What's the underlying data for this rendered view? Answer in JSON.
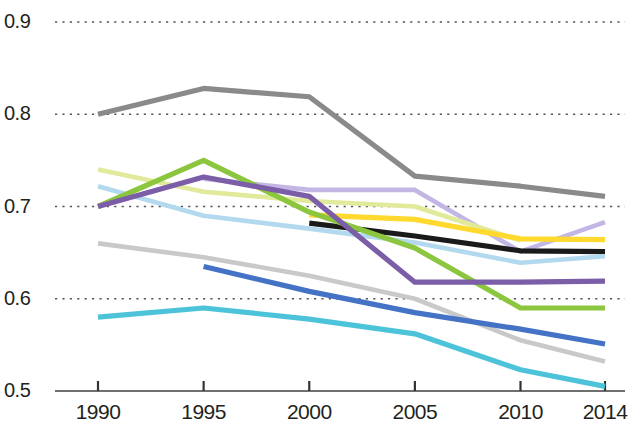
{
  "chart_data": {
    "type": "line",
    "title": "",
    "subtitle": "",
    "xlabel": "",
    "ylabel": "",
    "x": [
      1990,
      1995,
      2000,
      2005,
      2010,
      2014
    ],
    "xlim": [
      1988.2,
      2015.3
    ],
    "ylim": [
      0.5,
      0.92
    ],
    "grid": true,
    "grid_axis": "y",
    "grid_style": "dotted",
    "legend": "none",
    "xtick_labels": [
      "1990",
      "1995",
      "2000",
      "2005",
      "2010",
      "2014"
    ],
    "ytick_labels": [
      "0.9",
      "0.8",
      "0.7",
      "0.6",
      "0.5"
    ],
    "ytick_values": [
      0.9,
      0.8,
      0.7,
      0.6,
      0.5
    ],
    "series": [
      {
        "name": "dark-gray",
        "color": "#8a8a8a",
        "x": [
          1990,
          1995,
          2000,
          2005,
          2010,
          2014
        ],
        "values": [
          0.8,
          0.828,
          0.819,
          0.733,
          0.722,
          0.711
        ]
      },
      {
        "name": "lavender",
        "color": "#c3b6e4",
        "x": [
          1995,
          2000,
          2005,
          2010,
          2014
        ],
        "values": [
          0.73,
          0.718,
          0.718,
          0.651,
          0.683
        ]
      },
      {
        "name": "pale-yellow-green",
        "color": "#e1ea9b",
        "x": [
          1990,
          1995,
          2000,
          2005,
          2010
        ],
        "values": [
          0.74,
          0.716,
          0.706,
          0.7,
          0.663
        ]
      },
      {
        "name": "yellow",
        "color": "#ffd92e",
        "x": [
          2000,
          2005,
          2010,
          2014
        ],
        "values": [
          0.691,
          0.686,
          0.665,
          0.664
        ]
      },
      {
        "name": "black",
        "color": "#1a1a1a",
        "x": [
          2000,
          2005,
          2010,
          2014
        ],
        "values": [
          0.682,
          0.668,
          0.652,
          0.651
        ]
      },
      {
        "name": "light-blue",
        "color": "#b3d9ef",
        "x": [
          1990,
          1995,
          2000,
          2005,
          2010,
          2014
        ],
        "values": [
          0.722,
          0.69,
          0.676,
          0.661,
          0.639,
          0.646
        ]
      },
      {
        "name": "green",
        "color": "#8cc63e",
        "x": [
          1990,
          1995,
          2000,
          2005,
          2010,
          2014
        ],
        "values": [
          0.7,
          0.75,
          0.694,
          0.655,
          0.59,
          0.59
        ]
      },
      {
        "name": "purple",
        "color": "#7b5ea7",
        "x": [
          1990,
          1995,
          2000,
          2005,
          2010,
          2014
        ],
        "values": [
          0.7,
          0.732,
          0.711,
          0.618,
          0.618,
          0.619
        ]
      },
      {
        "name": "light-gray",
        "color": "#c9c9c9",
        "x": [
          1990,
          1995,
          2000,
          2005,
          2010,
          2014
        ],
        "values": [
          0.66,
          0.645,
          0.625,
          0.6,
          0.555,
          0.532
        ]
      },
      {
        "name": "blue",
        "color": "#4472c4",
        "x": [
          1995,
          2000,
          2005,
          2010,
          2014
        ],
        "values": [
          0.635,
          0.608,
          0.585,
          0.567,
          0.551
        ]
      },
      {
        "name": "cyan",
        "color": "#4cc3d9",
        "x": [
          1990,
          1995,
          2000,
          2005,
          2010,
          2014
        ],
        "values": [
          0.58,
          0.59,
          0.578,
          0.562,
          0.523,
          0.505
        ]
      }
    ]
  },
  "axis": {
    "y_labels": [
      "0.9",
      "0.8",
      "0.7",
      "0.6",
      "0.5"
    ],
    "x_labels": [
      "1990",
      "1995",
      "2000",
      "2005",
      "2010",
      "2014"
    ]
  }
}
